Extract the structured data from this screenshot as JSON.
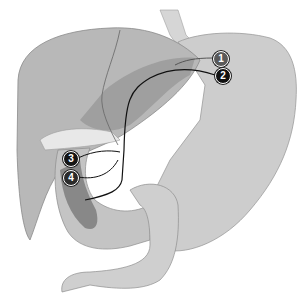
{
  "diagram": {
    "colors": {
      "background": "#ffffff",
      "liver": "#b8b8b8",
      "liver_dark": "#8f8f8f",
      "stomach": "#cdcdcd",
      "gallbladder": "#e6e6e6",
      "duodenum": "#c4c4c4",
      "pancreas_dark": "#7e7e7e",
      "lines": "#111111",
      "label_1": "#5a5a5a",
      "label_2": "#111111",
      "label_3": "#151515",
      "label_4": "#2a2a2a"
    },
    "labels": [
      {
        "id": "1",
        "text": "1",
        "x": 213,
        "y": 51
      },
      {
        "id": "2",
        "text": "2",
        "x": 215,
        "y": 68
      },
      {
        "id": "3",
        "text": "3",
        "x": 63,
        "y": 151
      },
      {
        "id": "4",
        "text": "4",
        "x": 63,
        "y": 170
      }
    ]
  }
}
